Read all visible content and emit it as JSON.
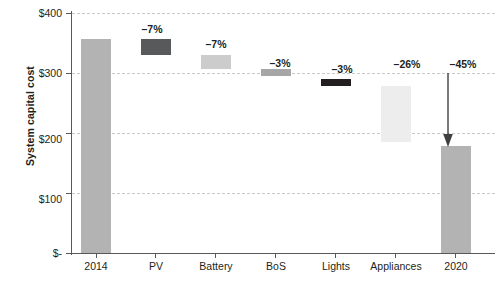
{
  "chart_data": {
    "type": "bar",
    "subtype": "waterfall",
    "title": "",
    "xlabel": "",
    "ylabel": "System capital cost",
    "ylim": [
      0,
      400
    ],
    "yticks": [
      0,
      100,
      200,
      300,
      400
    ],
    "ytick_labels": [
      "$-",
      "$100",
      "$200",
      "$300",
      "$400"
    ],
    "grid": true,
    "legend": "none",
    "categories": [
      "2014",
      "PV",
      "Battery",
      "BoS",
      "Lights",
      "Appliances",
      "2020"
    ],
    "bars": [
      {
        "category": "2014",
        "kind": "total",
        "base": 0,
        "top": 357,
        "value": 357,
        "delta_label": "",
        "color": "#b3b3b3"
      },
      {
        "category": "PV",
        "kind": "decrease",
        "base": 330,
        "top": 357,
        "value": -27,
        "delta_label": "–7%",
        "color": "#58595b"
      },
      {
        "category": "Battery",
        "kind": "decrease",
        "base": 307,
        "top": 330,
        "value": -23,
        "delta_label": "–7%",
        "color": "#cccccc"
      },
      {
        "category": "BoS",
        "kind": "decrease",
        "base": 295,
        "top": 307,
        "value": -12,
        "delta_label": "–3%",
        "color": "#a6a6a6"
      },
      {
        "category": "Lights",
        "kind": "decrease",
        "base": 279,
        "top": 290,
        "value": -11,
        "delta_label": "–3%",
        "color": "#231f20"
      },
      {
        "category": "Appliances",
        "kind": "decrease",
        "base": 185,
        "top": 278,
        "value": -93,
        "delta_label": "–26%",
        "color": "#ededed"
      },
      {
        "category": "2020",
        "kind": "total",
        "base": 0,
        "top": 178,
        "value": 178,
        "delta_label": "–45%",
        "color": "#b3b3b3"
      }
    ],
    "annotations": [
      {
        "name": "total-drop-arrow",
        "type": "arrow",
        "from_value": 300,
        "to_value": 184,
        "at_category": "2020",
        "label": "–45%"
      }
    ]
  },
  "axis": {
    "y_title": "System capital cost",
    "y_tick_labels": [
      "$400",
      "$300",
      "$200",
      "$100",
      "$-"
    ],
    "x_tick_labels": [
      "2014",
      "PV",
      "Battery",
      "BoS",
      "Lights",
      "Appliances",
      "2020"
    ]
  },
  "labels": {
    "pv": "–7%",
    "battery": "–7%",
    "bos": "–3%",
    "lights": "–3%",
    "appliances": "–26%",
    "total": "–45%"
  },
  "colors": {
    "axis": "#58595b",
    "grid": "#c9c9c9",
    "text": "#231f20",
    "bar_total": "#b3b3b3",
    "bar_pv": "#58595b",
    "bar_battery": "#cccccc",
    "bar_bos": "#a6a6a6",
    "bar_lights": "#231f20",
    "bar_appliances": "#ededed",
    "arrow": "#404040"
  }
}
